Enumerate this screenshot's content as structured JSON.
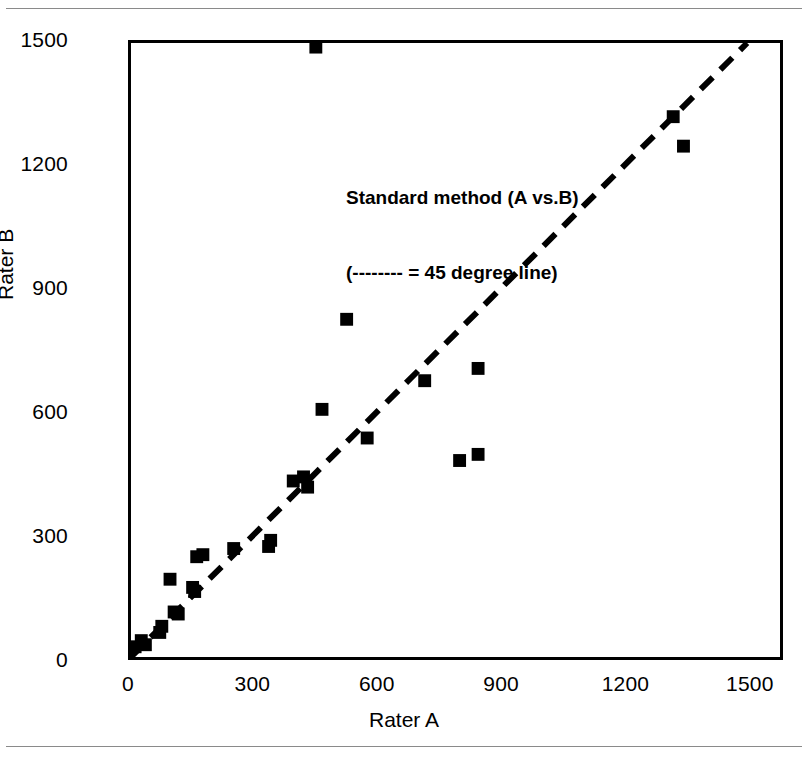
{
  "figure": {
    "annotation_line_1": "Standard method (A vs.B)",
    "annotation_line_2": "(-------- = 45 degree line)",
    "marker_color": "#000000",
    "line_color": "#000000",
    "frame_color": "#000000",
    "background": "#ffffff"
  },
  "chart_data": {
    "type": "scatter",
    "title": "Standard method (A vs.B)",
    "subtitle": "(-------- = 45 degree line)",
    "xlabel": "Rater A",
    "ylabel": "Rater B",
    "xlim": [
      0,
      1580
    ],
    "ylim": [
      0,
      1500
    ],
    "xticks": [
      0,
      300,
      600,
      900,
      1200,
      1500
    ],
    "yticks": [
      0,
      300,
      600,
      900,
      1200,
      1500
    ],
    "xtick_labels": [
      "0",
      "300",
      "600",
      "900",
      "1200",
      "1500"
    ],
    "ytick_labels": [
      "0",
      "300",
      "600",
      "900",
      "1200",
      "1500"
    ],
    "grid": false,
    "legend": false,
    "reference_line": {
      "label": "45 degree line",
      "style": "dashed",
      "from": [
        0,
        0
      ],
      "to": [
        1500,
        1500
      ]
    },
    "series": [
      {
        "name": "Rater A vs Rater B",
        "marker": "square",
        "points": [
          [
            10,
            25
          ],
          [
            25,
            40
          ],
          [
            35,
            30
          ],
          [
            70,
            60
          ],
          [
            75,
            75
          ],
          [
            95,
            190
          ],
          [
            105,
            110
          ],
          [
            115,
            105
          ],
          [
            150,
            170
          ],
          [
            155,
            160
          ],
          [
            160,
            245
          ],
          [
            175,
            250
          ],
          [
            250,
            265
          ],
          [
            335,
            270
          ],
          [
            340,
            285
          ],
          [
            395,
            430
          ],
          [
            420,
            440
          ],
          [
            430,
            415
          ],
          [
            450,
            1490
          ],
          [
            465,
            605
          ],
          [
            525,
            825
          ],
          [
            575,
            535
          ],
          [
            715,
            675
          ],
          [
            800,
            480
          ],
          [
            845,
            495
          ],
          [
            845,
            705
          ],
          [
            1320,
            1320
          ],
          [
            1345,
            1248
          ]
        ]
      }
    ]
  },
  "axes": {
    "x_title": "Rater A",
    "y_title": "Rater B",
    "x_ticks": [
      {
        "label": "0",
        "value": 0
      },
      {
        "label": "300",
        "value": 300
      },
      {
        "label": "600",
        "value": 600
      },
      {
        "label": "900",
        "value": 900
      },
      {
        "label": "1200",
        "value": 1200
      },
      {
        "label": "1500",
        "value": 1500
      }
    ],
    "y_ticks": [
      {
        "label": "0",
        "value": 0
      },
      {
        "label": "300",
        "value": 300
      },
      {
        "label": "600",
        "value": 600
      },
      {
        "label": "900",
        "value": 900
      },
      {
        "label": "1200",
        "value": 1200
      },
      {
        "label": "1500",
        "value": 1500
      }
    ]
  }
}
